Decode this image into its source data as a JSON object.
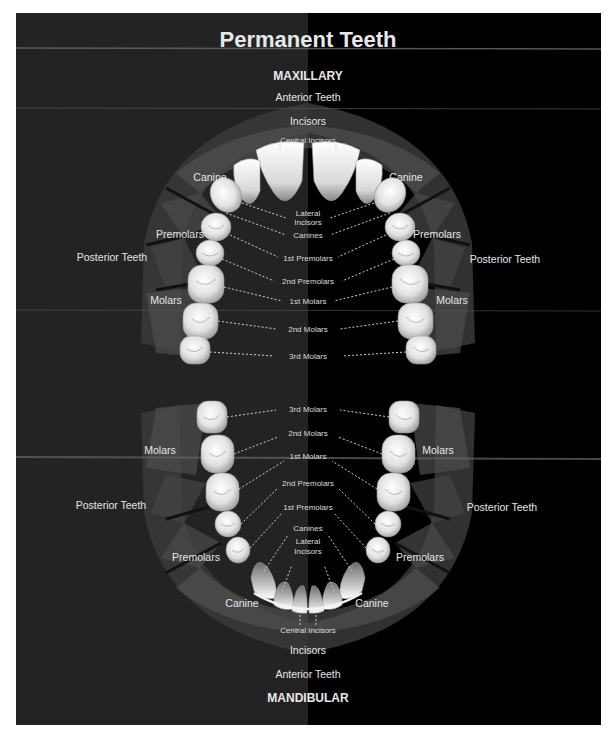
{
  "title": "Permanent Teeth",
  "maxillary": {
    "jaw_label": "MAXILLARY",
    "region_anterior": "Anterior Teeth",
    "region_posterior_left": "Posterior Teeth",
    "region_posterior_right": "Posterior Teeth",
    "groups": {
      "incisors": "Incisors",
      "canine_left": "Canine",
      "canine_right": "Canine",
      "premolars_left": "Premolars",
      "premolars_right": "Premolars",
      "molars_left": "Molars",
      "molars_right": "Molars"
    },
    "tooth_labels": {
      "central_incisors": "Central Incisors",
      "lateral_incisors_1": "Lateral",
      "lateral_incisors_2": "Incisors",
      "canines": "Canines",
      "first_premolars": "1st Premolars",
      "second_premolars": "2nd Premolars",
      "first_molars": "1st Molars",
      "second_molars": "2nd Molars",
      "third_molars": "3rd Molars"
    }
  },
  "mandibular": {
    "jaw_label": "MANDIBULAR",
    "region_anterior": "Anterior Teeth",
    "region_posterior_left": "Posterior Teeth",
    "region_posterior_right": "Posterior Teeth",
    "groups": {
      "incisors": "Incisors",
      "canine_left": "Canine",
      "canine_right": "Canine",
      "premolars_left": "Premolars",
      "premolars_right": "Premolars",
      "molars_left": "Molars",
      "molars_right": "Molars"
    },
    "tooth_labels": {
      "third_molars": "3rd Molars",
      "second_molars": "2nd Molars",
      "first_molars": "1st Molars",
      "second_premolars": "2nd Premolars",
      "first_premolars": "1st Premolars",
      "canines": "Canines",
      "lateral_incisors_1": "Lateral",
      "lateral_incisors_2": "Incisors",
      "central_incisors": "Central Incisors"
    }
  },
  "colors": {
    "background_left": "#232323",
    "background_right": "#000000",
    "band_outer": "#3a3a3a",
    "band_inner": "#4a4a4a",
    "tooth": "#eeeeee",
    "text": "#e6e6e6"
  }
}
